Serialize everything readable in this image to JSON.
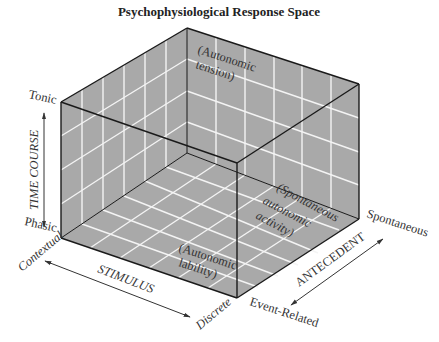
{
  "title": "Psychophysiological Response Space",
  "axes": {
    "time_course": {
      "label": "TIME COURSE",
      "top": "Tonic",
      "bottom": "Phasic"
    },
    "stimulus": {
      "label": "STIMULUS",
      "start": "Contextual",
      "end": "Discrete"
    },
    "antecedent": {
      "label": "ANTECEDENT",
      "start": "Event-Related",
      "end": "Spontaneous"
    }
  },
  "regions": {
    "tension": {
      "line1": "(Autonomic",
      "line2": "tension)"
    },
    "lability": {
      "line1": "(Autonomic",
      "line2": "lability)"
    },
    "spontaneous": {
      "line1": "(Spontaneous",
      "line2": "autonomic",
      "line3": "activity)"
    }
  },
  "colors": {
    "panel": "#a9a9a9",
    "grid": "#f4f4f4",
    "edge": "#1a1a1a"
  },
  "box": {
    "front_top_left": [
      61,
      102
    ],
    "front_bottom_left": [
      61,
      238
    ],
    "back_top": [
      187,
      28
    ],
    "back_bottom": [
      187,
      153
    ],
    "front_top_corner": [
      237,
      163
    ],
    "front_bottom_corner": [
      237,
      298
    ],
    "right_top": [
      359,
      84
    ],
    "right_bottom": [
      359,
      219
    ],
    "divisions": 6
  }
}
